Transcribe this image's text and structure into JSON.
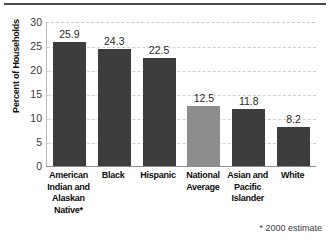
{
  "chart_data": {
    "type": "bar",
    "title": "",
    "xlabel": "",
    "ylabel": "Percent of Households",
    "ylim": [
      0,
      30
    ],
    "ytick_step": 5,
    "yticks": [
      "30",
      "25",
      "20",
      "15",
      "10",
      "5",
      "0"
    ],
    "grid": true,
    "legend": "none",
    "categories": [
      "American Indian and Alaskan Native*",
      "Black",
      "Hispanic",
      "National Average",
      "Asian and Pacific Islander",
      "White"
    ],
    "category_lines": [
      [
        "American",
        "Indian and",
        "Alaskan",
        "Native*"
      ],
      [
        "Black"
      ],
      [
        "Hispanic"
      ],
      [
        "National",
        "Average"
      ],
      [
        "Asian and",
        "Pacific",
        "Islander"
      ],
      [
        "White"
      ]
    ],
    "values": [
      25.9,
      24.3,
      22.5,
      12.5,
      11.8,
      8.2
    ],
    "value_labels": [
      "25.9",
      "24.3",
      "22.5",
      "12.5",
      "11.8",
      "8.2"
    ],
    "bar_colors": [
      "#3d3d3d",
      "#3d3d3d",
      "#3d3d3d",
      "#8d8d8d",
      "#3d3d3d",
      "#3d3d3d"
    ],
    "annotations": [
      "* 2000 estimate"
    ]
  },
  "footnote": "* 2000 estimate",
  "colors": {
    "bar_dark": "#3d3d3d",
    "bar_light": "#8d8d8d",
    "grid": "#cfcfcf",
    "axis": "#8e8e8e",
    "text": "#111111",
    "background": "#ffffff"
  }
}
